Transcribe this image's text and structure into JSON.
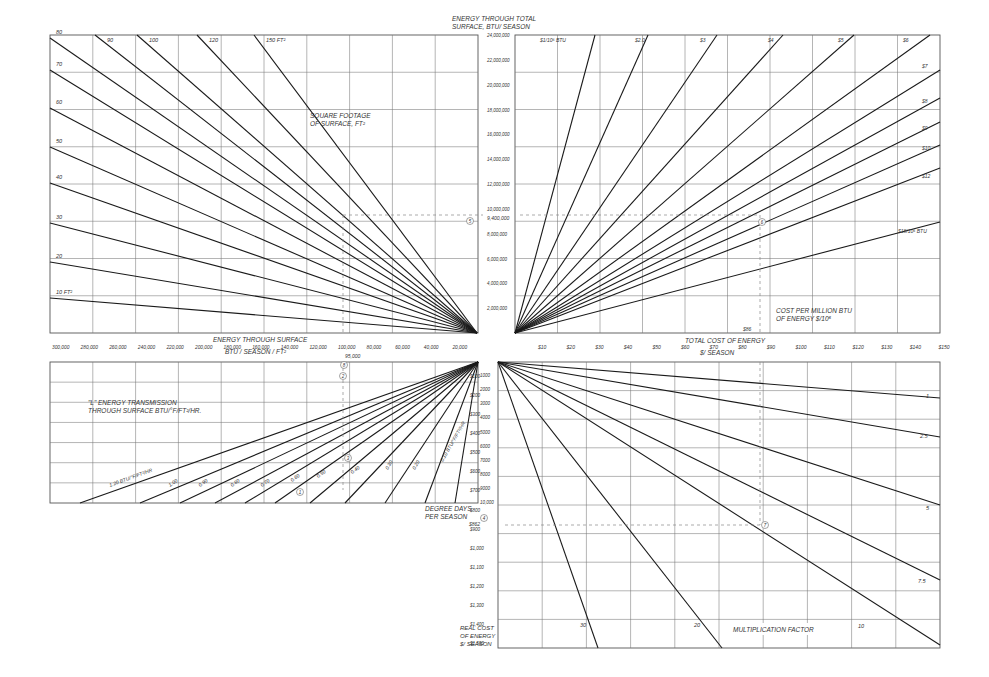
{
  "chart_data": {
    "type": "nomograph",
    "quadrants": {
      "top_left": {
        "title": "SQUARE FOOTAGE OF SURFACE, FT²",
        "type": "line",
        "line_labels": [
          "10 FT²",
          "20",
          "30",
          "40",
          "50",
          "60",
          "70",
          "80",
          "90",
          "100",
          "120",
          "150 FT²"
        ],
        "x_axis_label": "ENERGY THROUGH SURFACE BTU / SEASON / FT²",
        "x_ticks": [
          "300,000",
          "280,000",
          "260,000",
          "240,000",
          "220,000",
          "200,000",
          "180,000",
          "160,000",
          "140,000",
          "120,000",
          "100,000",
          "80,000",
          "60,000",
          "40,000",
          "20,000"
        ]
      },
      "center_vertical_axis": {
        "label": "ENERGY THROUGH TOTAL SURFACE, BTU / SEASON",
        "ticks": [
          "2,000,000",
          "4,000,000",
          "6,000,000",
          "8,000,000",
          "10,000,000",
          "12,000,000",
          "14,000,000",
          "16,000,000",
          "18,000,000",
          "20,000,000",
          "22,000,000",
          "24,000,000"
        ],
        "marked_value": "9,400,000"
      },
      "top_right": {
        "title": "COST PER MILLION BTU OF ENERGY $/10⁶",
        "type": "line",
        "line_labels": [
          "$1/10⁶ BTU",
          "$2.0",
          "$3",
          "$4",
          "$5",
          "$6",
          "$7",
          "$8",
          "$9",
          "$10",
          "$12",
          "$18/10⁶ BTU"
        ],
        "x_axis_label": "TOTAL COST OF ENERGY $/ SEASON",
        "x_ticks": [
          "$10",
          "$20",
          "$30",
          "$40",
          "$50",
          "$60",
          "$70",
          "$80",
          "$90",
          "$100",
          "$110",
          "$120",
          "$130",
          "$140",
          "$150"
        ],
        "marked_value": "$86"
      },
      "bottom_left": {
        "title": "\"L\" ENERGY TRANSMISSION THROUGH SURFACE BTU/°F/FT²/HR.",
        "type": "line",
        "line_labels": [
          "1.20 BTU/°F/FT²/HR",
          "1.00",
          "0.90",
          "0.80",
          "0.70",
          "0.60",
          "0.50",
          "0.40",
          "0.30",
          "0.20",
          "0.10 BTU/°F/FT²/HR"
        ],
        "y_axis_label": "DEGREE DAYS PER SEASON",
        "y_ticks": [
          "1000",
          "2000",
          "3000",
          "4000",
          "5000",
          "6000",
          "7000",
          "8000",
          "9000",
          "10,000"
        ],
        "marked_value": "95,000"
      },
      "bottom_right": {
        "title": "MULTIPLICATION FACTOR",
        "type": "line",
        "line_labels": [
          "1",
          "2.5",
          "5",
          "7.5",
          "10",
          "20",
          "30"
        ],
        "y_axis_label": "REAL COST OF ENERGY $/ SEASON",
        "y_ticks": [
          "$100",
          "$200",
          "$300",
          "$400",
          "$500",
          "$600",
          "$700",
          "$800",
          "$900",
          "$1,000",
          "$1,100",
          "$1,200",
          "$1,300",
          "$1,400",
          "$1,500"
        ],
        "marked_value": "$862"
      }
    },
    "example_path_steps": [
      "1",
      "2",
      "3",
      "4",
      "5",
      "6",
      "7",
      "8"
    ],
    "grid": true
  },
  "labels": {
    "tl_title_1": "SQUARE FOOTAGE",
    "tl_title_2": "OF SURFACE, FT²",
    "center_title_1": "ENERGY THROUGH TOTAL",
    "center_title_2": "SURFACE, BTU/ SEASON",
    "tr_title_1": "COST PER MILLION BTU",
    "tr_title_2": "OF ENERGY  $/10⁶",
    "left_axis_1": "ENERGY THROUGH SURFACE",
    "left_axis_2": "BTU / SEASON / FT²",
    "right_axis_1": "TOTAL COST OF ENERGY",
    "right_axis_2": "$/ SEASON",
    "bl_title_1": "\"L\" ENERGY TRANSMISSION",
    "bl_title_2": "THROUGH SURFACE  BTU/°F/FT²/HR.",
    "dd_1": "DEGREE DAYS",
    "dd_2": "PER SEASON",
    "rc_1": "REAL COST",
    "rc_2": "OF ENERGY",
    "rc_3": "$/ SEASON",
    "mf": "MULTIPLICATION FACTOR",
    "mark_9400": "9,400,000",
    "mark_86": "$86",
    "mark_95000": "95,000",
    "mark_862": "$862"
  }
}
